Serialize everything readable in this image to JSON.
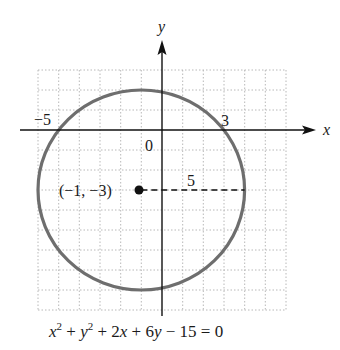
{
  "figure": {
    "axes": {
      "x_label": "x",
      "y_label": "y",
      "origin_label": "0",
      "x_range": [
        -6,
        6
      ],
      "y_range": [
        -9,
        3
      ],
      "grid": "dotted, 1-unit spacing"
    },
    "intercept_labels": {
      "left": "−5",
      "right": "3"
    },
    "circle": {
      "center": [
        -1,
        -3
      ],
      "radius": 5,
      "stroke_color": "#6e6e6e"
    },
    "center_label": "(−1, −3)",
    "radius_label": "5",
    "equation": {
      "x": "x",
      "y": "y",
      "exp": "2",
      "plus1": " + ",
      "plus2": " + 2",
      "plus3": " + 6",
      "tail": " − 15 = 0"
    }
  }
}
